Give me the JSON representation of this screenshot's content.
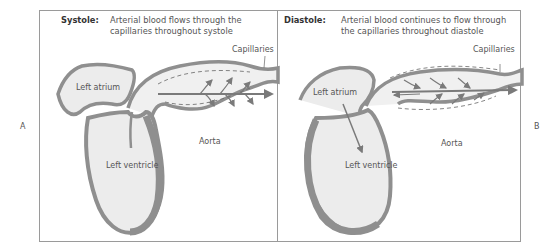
{
  "figure": {
    "panels": [
      {
        "id": "A",
        "panel_label": "A",
        "phase": "Systole:",
        "description_line1": "Arterial blood flows through the",
        "description_line2": "capillaries throughout systole",
        "labels": {
          "capillaries": "Capillaries",
          "left_atrium": "Left atrium",
          "left_ventricle": "Left ventricle",
          "aorta": "Aorta"
        }
      },
      {
        "id": "B",
        "panel_label": "B",
        "phase": "Diastole:",
        "description_line1": "Arterial blood continues to flow through",
        "description_line2": "the capillaries throughout diastole",
        "labels": {
          "capillaries": "Capillaries",
          "left_atrium": "Left atrium",
          "left_ventricle": "Left ventricle",
          "aorta": "Aorta"
        }
      }
    ],
    "colors": {
      "wall": "#8f8f8f",
      "chamber_fill": "#ececec",
      "outline": "#6a6a6a",
      "arrow": "#7a7a7a",
      "frame": "#9a9a9a"
    }
  }
}
